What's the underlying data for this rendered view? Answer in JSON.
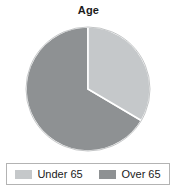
{
  "chart_data": {
    "type": "pie",
    "title": "Age",
    "categories": [
      "Under 65",
      "Over 65"
    ],
    "values": [
      33.5,
      66.5
    ],
    "unit": "percent",
    "start_angle_deg": 0,
    "direction": "clockwise",
    "colors": [
      "#c5c8ca",
      "#8e9193"
    ],
    "legend_position": "bottom",
    "legend_border_color": "#b3b3b3",
    "slice_divider_color": "#ffffff",
    "background": "#ffffff",
    "xlabel": "",
    "ylabel": "",
    "grid": false,
    "slices": [
      {
        "label": "Under 65",
        "value": 33.5,
        "color": "#c5c8ca",
        "start_deg": 0,
        "end_deg": 120.6
      },
      {
        "label": "Over 65",
        "value": 66.5,
        "color": "#8e9193",
        "start_deg": 120.6,
        "end_deg": 360
      }
    ]
  },
  "legend": {
    "items": [
      {
        "label": "Under 65",
        "swatch_name": "legend-swatch-under-65"
      },
      {
        "label": "Over 65",
        "swatch_name": "legend-swatch-over-65"
      }
    ]
  }
}
